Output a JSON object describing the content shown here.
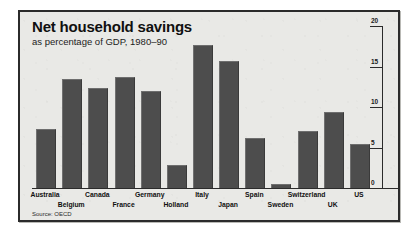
{
  "chart_data": {
    "type": "bar",
    "title": "Net household savings",
    "subtitle": "as percentage of GDP, 1980–90",
    "source": "Source: OECD",
    "xlabel": "",
    "ylabel": "",
    "ylim": [
      0,
      20
    ],
    "yticks": [
      0,
      5,
      10,
      15,
      20
    ],
    "ytick_labels": [
      "0",
      "5",
      "10",
      "15",
      "20"
    ],
    "axis_position": "right",
    "grid": false,
    "legend": "none",
    "bar_color": "#4d4d4d",
    "background_color": "#e9e9e6",
    "frame_color": "#2b2b2b",
    "categories": [
      "Australia",
      "Belgium",
      "Canada",
      "France",
      "Germany",
      "Holland",
      "Italy",
      "Japan",
      "Spain",
      "Sweden",
      "Switzerland",
      "UK",
      "US"
    ],
    "label_rows": [
      0,
      1,
      0,
      1,
      0,
      1,
      0,
      1,
      0,
      1,
      0,
      1,
      0
    ],
    "values": [
      7.2,
      13.3,
      12.2,
      13.6,
      11.8,
      2.7,
      17.5,
      15.5,
      6.1,
      0.4,
      6.9,
      9.3,
      5.3
    ]
  }
}
